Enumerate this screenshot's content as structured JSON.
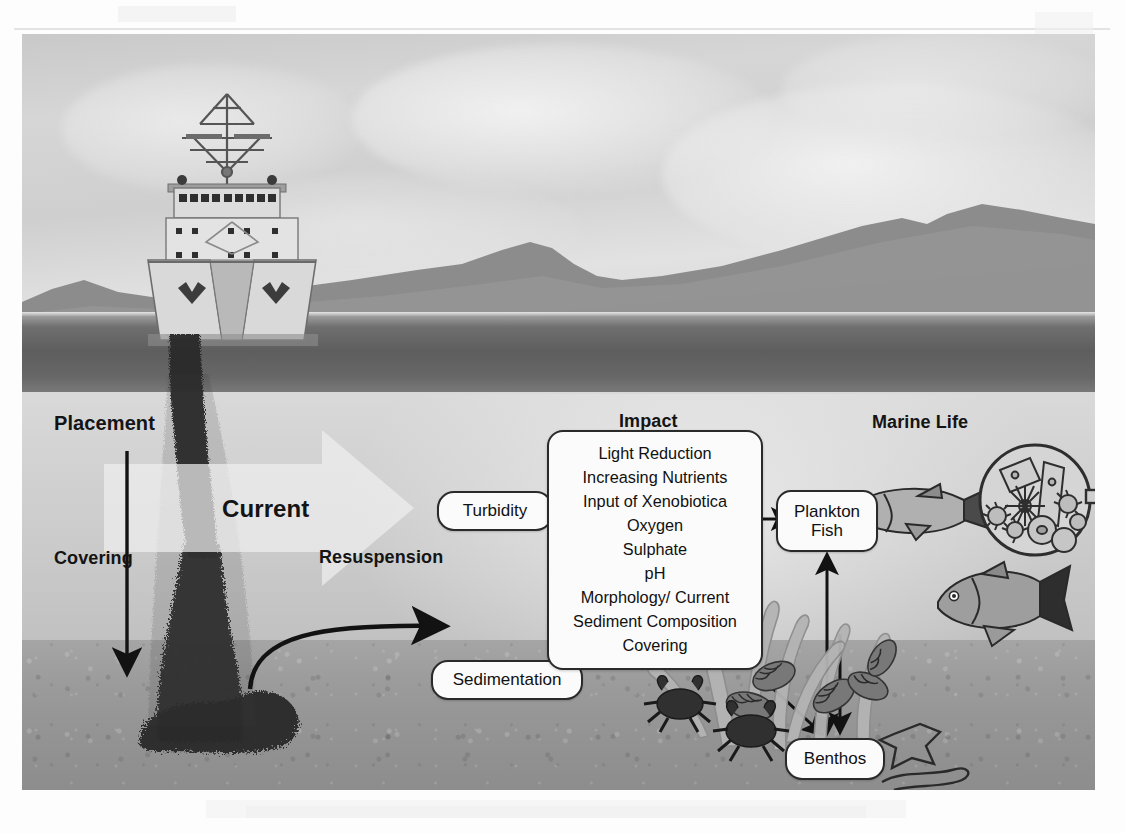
{
  "figure": {
    "domain": "scientific-diagram"
  },
  "labels": {
    "placement": "Placement",
    "covering": "Covering",
    "current": "Current",
    "resuspension": "Resuspension",
    "impact": "Impact",
    "marine_life": "Marine Life"
  },
  "nodes": {
    "turbidity": "Turbidity",
    "sedimentation": "Sedimentation",
    "plankton_line1": "Plankton",
    "plankton_line2": "Fish",
    "benthos": "Benthos"
  },
  "impact_box": {
    "heading": "Impact",
    "items": [
      "Light Reduction",
      "Increasing Nutrients",
      "Input of Xenobiotica",
      "Oxygen",
      "Sulphate",
      "pH",
      "Morphology/ Current",
      "Sediment Composition",
      "Covering"
    ]
  },
  "scene": {
    "vessel": "split-hopper-dredger-stern-view",
    "plume": "sediment-discharge-plume",
    "deposit": "sediment-mound-on-seabed",
    "horizon": "distant-hills",
    "seabed": "textured-sediment-floor"
  },
  "organisms": [
    {
      "name": "fish-upper",
      "kind": "fish"
    },
    {
      "name": "fish-lower",
      "kind": "fish"
    },
    {
      "name": "plankton-microscope-view",
      "kind": "plankton"
    },
    {
      "name": "seaweed",
      "kind": "macroalgae"
    },
    {
      "name": "mussels",
      "kind": "bivalve"
    },
    {
      "name": "crab-left",
      "kind": "crustacean"
    },
    {
      "name": "crab-right",
      "kind": "crustacean"
    },
    {
      "name": "starfish",
      "kind": "echinoderm"
    },
    {
      "name": "worm",
      "kind": "annelid"
    }
  ],
  "arrows": [
    {
      "name": "placement-down-arrow",
      "from": "Placement",
      "to": "seabed"
    },
    {
      "name": "current-arrow",
      "direction": "right"
    },
    {
      "name": "resuspension-curve-arrow",
      "from": "deposit",
      "to": "water-column"
    },
    {
      "name": "turbidity-to-impact",
      "from": "Turbidity",
      "to": "Impact"
    },
    {
      "name": "sedimentation-to-impact",
      "from": "Sedimentation",
      "to": "Impact"
    },
    {
      "name": "impact-to-plankton",
      "from": "Impact",
      "to": "Plankton Fish"
    },
    {
      "name": "impact-to-benthos",
      "from": "Impact",
      "to": "Benthos"
    },
    {
      "name": "plankton-benthos-double",
      "from": "Plankton Fish",
      "to": "Benthos",
      "direction": "both"
    }
  ],
  "colors": {
    "ink": "#141414",
    "box_fill": "#fbfbfb",
    "box_border": "#2a2a2a",
    "sky": "#d4d4d4",
    "sea_surface": "#5e5e5e",
    "water": "#cfcfcf",
    "seabed": "#9a9a9a",
    "plume": "#2c2c2c",
    "current_arrow": "#ececec"
  }
}
